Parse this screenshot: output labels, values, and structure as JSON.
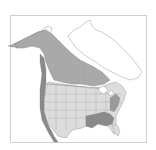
{
  "map": {
    "subject": "species range map",
    "region": "North America",
    "legend": [
      {
        "name": "breeding-range",
        "color": "#a9a9a9"
      },
      {
        "name": "year-round-range",
        "color": "#8a8a8a"
      },
      {
        "name": "nonbreeding-range",
        "color": "#dcdcdc"
      }
    ],
    "colors": {
      "land": "#ffffff",
      "borders": "#8c8c8c",
      "frame": "#cfcfcf"
    }
  }
}
